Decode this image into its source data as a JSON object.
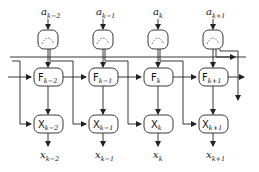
{
  "diagram": {
    "type": "signal-flow / recursive processing chain",
    "columns": [
      {
        "input": "a",
        "input_sub": "k−2",
        "f_node": "F",
        "f_sub": "k−2",
        "x_node": "X",
        "x_sub": "k−2",
        "output": "x",
        "output_sub": "k−2"
      },
      {
        "input": "a",
        "input_sub": "k−1",
        "f_node": "F",
        "f_sub": "k−1",
        "x_node": "X",
        "x_sub": "k−1",
        "output": "x",
        "output_sub": "k−1"
      },
      {
        "input": "a",
        "input_sub": "k",
        "f_node": "F",
        "f_sub": "k",
        "x_node": "X",
        "x_sub": "k",
        "output": "x",
        "output_sub": "k"
      },
      {
        "input": "a",
        "input_sub": "k+1",
        "f_node": "F",
        "f_sub": "k+1",
        "x_node": "X",
        "x_sub": "k+1",
        "output": "x",
        "output_sub": "k+1"
      }
    ],
    "top_node_icon": "dashed-arc-splitter-icon",
    "colors": {
      "stroke": "#222222",
      "background": "#ffffff"
    }
  }
}
